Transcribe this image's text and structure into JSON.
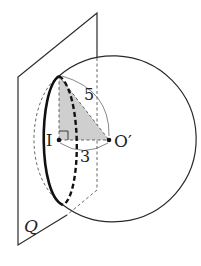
{
  "figure": {
    "plane_label": "Q",
    "center_label": "O′",
    "point_label": "I",
    "hypotenuse_label": "5",
    "base_label": "3"
  },
  "colors": {
    "stroke": "#2a2a2a",
    "dashed": "#555555",
    "shade": "#cfcfcf",
    "background": "#ffffff"
  }
}
